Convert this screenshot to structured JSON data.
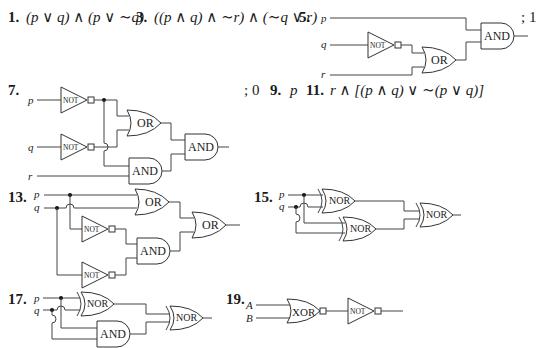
{
  "problems": {
    "p1": {
      "number": "1.",
      "expression": "(p ∨ q) ∧ (p ∨ ∼q)"
    },
    "p3": {
      "number": "3.",
      "expression": "((p ∧ q) ∧ ∼r) ∧ (∼q ∨ r)"
    },
    "p5": {
      "number": "5.",
      "inputs": [
        "p",
        "q",
        "r"
      ],
      "gates": [
        "NOT",
        "OR",
        "AND"
      ],
      "answer": "; 1"
    },
    "p7": {
      "number": "7.",
      "inputs": [
        "p",
        "q",
        "r"
      ],
      "gates": [
        "NOT",
        "NOT",
        "OR",
        "AND",
        "AND"
      ],
      "answer": "; 0"
    },
    "p9": {
      "number": "9.",
      "expression": "p"
    },
    "p11": {
      "number": "11.",
      "expression": "r ∧ [(p ∧ q) ∨ ∼(p ∨ q)]"
    },
    "p13": {
      "number": "13.",
      "inputs": [
        "p",
        "q"
      ],
      "gates": [
        "OR",
        "NOT",
        "NOT",
        "AND",
        "OR"
      ]
    },
    "p15": {
      "number": "15.",
      "inputs": [
        "p",
        "q"
      ],
      "gates": [
        "NOR",
        "NOR",
        "NOR"
      ]
    },
    "p17": {
      "number": "17.",
      "inputs": [
        "p",
        "q"
      ],
      "gates": [
        "NOR",
        "AND",
        "NOR"
      ]
    },
    "p19": {
      "number": "19.",
      "inputs": [
        "A",
        "B"
      ],
      "gates": [
        "XOR",
        "NOT"
      ]
    }
  },
  "gate_labels": {
    "and": "AND",
    "or": "OR",
    "not": "NOT",
    "nor": "NOR",
    "xor": "XOR"
  }
}
